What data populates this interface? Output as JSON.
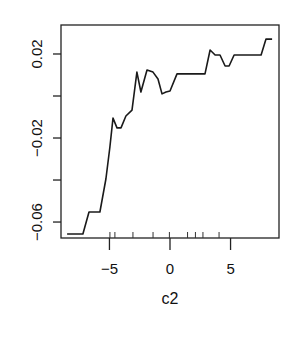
{
  "chart_data": {
    "type": "line",
    "title": "",
    "xlabel": "c2",
    "ylabel": "",
    "xlim": [
      -9.0,
      9.0
    ],
    "ylim": [
      -0.0676,
      0.0338
    ],
    "grid": false,
    "legend": null,
    "x_ticks": [
      -5,
      0,
      5
    ],
    "x_tick_labels": [
      "-5",
      "0",
      "5"
    ],
    "y_ticks": [
      0.02,
      0.0,
      -0.02,
      -0.04,
      -0.06
    ],
    "y_tick_labels": [
      "0.02",
      "",
      "-0.02",
      "",
      "-0.06"
    ],
    "rug_x": [
      -4.96,
      -4.55,
      -3.06,
      -1.4,
      -0.05,
      1.45,
      2.1,
      2.72,
      4.05
    ],
    "series": [
      {
        "name": "partial dependence",
        "x": [
          -8.5,
          -7.19,
          -6.69,
          -5.79,
          -5.29,
          -4.96,
          -4.71,
          -4.38,
          -4.05,
          -3.64,
          -3.14,
          -2.73,
          -2.4,
          -1.9,
          -1.4,
          -0.99,
          -0.66,
          -0.33,
          0.0,
          0.58,
          2.89,
          3.31,
          3.72,
          4.13,
          4.55,
          4.88,
          5.29,
          7.52,
          7.93,
          8.43
        ],
        "y": [
          -0.0657,
          -0.0657,
          -0.0552,
          -0.0552,
          -0.0395,
          -0.0243,
          -0.0105,
          -0.0152,
          -0.0152,
          -0.0095,
          -0.0067,
          0.0114,
          0.0019,
          0.0124,
          0.0114,
          0.0081,
          0.001,
          0.0019,
          0.0024,
          0.0105,
          0.0105,
          0.0219,
          0.0195,
          0.0195,
          0.0143,
          0.0143,
          0.0195,
          0.0195,
          0.0271,
          0.0271
        ]
      }
    ]
  },
  "axes": {
    "x_title": "c2",
    "x_tick_labels": [
      "-5",
      "0",
      "5"
    ],
    "y_tick_labels": [
      "0.02",
      "-0.02",
      "-0.06"
    ]
  }
}
